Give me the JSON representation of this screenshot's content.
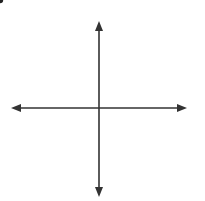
{
  "diagram": {
    "type": "coordinate-plane",
    "x_axis": {
      "label": "x",
      "ticks": [
        "−5",
        "−4",
        "−3",
        "−2",
        "−1",
        "1",
        "2",
        "3",
        "4",
        "5"
      ],
      "tick_values": [
        -5,
        -4,
        -3,
        -2,
        -1,
        1,
        2,
        3,
        4,
        5
      ]
    },
    "y_axis": {
      "label": "y",
      "ticks": [
        "5",
        "4",
        "3",
        "2",
        "1",
        "−1",
        "−2",
        "−3",
        "−4",
        "−5"
      ],
      "tick_values": [
        5,
        4,
        3,
        2,
        1,
        -1,
        -2,
        -3,
        -4,
        -5
      ]
    },
    "origin_label": "0",
    "grid_range": {
      "x": [
        -6,
        6
      ],
      "y": [
        -6,
        6
      ]
    },
    "point": {
      "x": -4,
      "y": 3,
      "label": "(−4, 3)"
    },
    "colors": {
      "grid": "#cfcfcf",
      "axis": "#333333",
      "point": "#222222",
      "text": "#555555"
    }
  }
}
